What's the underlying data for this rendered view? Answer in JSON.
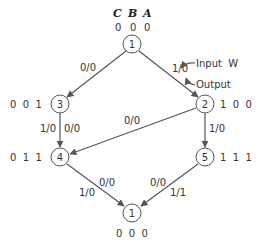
{
  "header": {
    "labels": [
      "C",
      "B",
      "A"
    ],
    "initial_code": [
      "0",
      "0",
      "0"
    ]
  },
  "nodes": [
    {
      "id": "1",
      "code": "0 0 0"
    },
    {
      "id": "2",
      "code": "1 0 0"
    },
    {
      "id": "3",
      "code": "0 0 1"
    },
    {
      "id": "4",
      "code": "0 1 1"
    },
    {
      "id": "5",
      "code": "1 1 1"
    },
    {
      "id": "1",
      "code": "0 0 0"
    }
  ],
  "edges": [
    {
      "from": "1",
      "to": "3",
      "label": "0/0"
    },
    {
      "from": "1",
      "to": "2",
      "label": "1/0"
    },
    {
      "from": "3",
      "to": "4",
      "label_left": "1/0",
      "label_right": "0/0"
    },
    {
      "from": "2",
      "to": "4",
      "label": "0/0"
    },
    {
      "from": "2",
      "to": "5",
      "label": "1/0"
    },
    {
      "from": "4",
      "to": "1",
      "label_left": "1/0",
      "label_right": "0/0"
    },
    {
      "from": "5",
      "to": "1",
      "label_left": "0/0",
      "label_right": "1/1"
    }
  ],
  "annotations": {
    "input": "Input W",
    "output": "Output"
  }
}
